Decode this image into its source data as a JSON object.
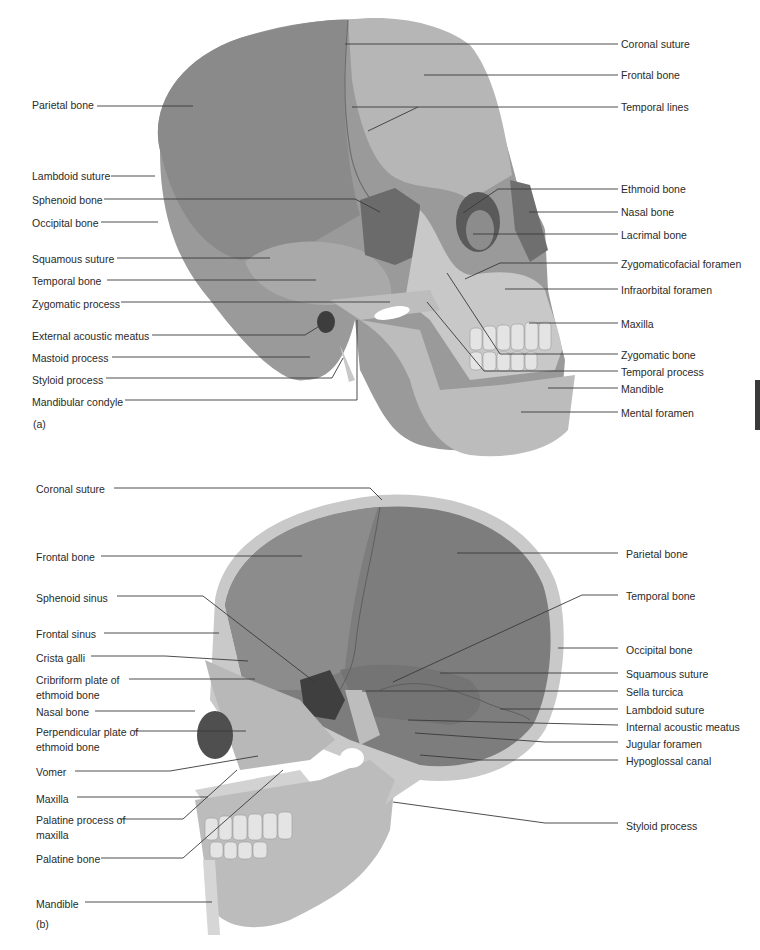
{
  "figure": {
    "colors": {
      "background": "#ffffff",
      "label_text": "#2a2a2a",
      "leader_line": "#3a3a3a",
      "parietal": "#8e8e8e",
      "frontal": "#b4b4b4",
      "sphenoid": "#6e6e6e",
      "face_bone": "#c8c8c8",
      "inner_vault": "#7d7d7d",
      "cut_edge": "#c9c9c9",
      "teeth": "#e4e4e4"
    },
    "panel_a": {
      "tag": "(a)",
      "left_labels": [
        {
          "text": "Parietal bone",
          "x": 32,
          "y": 99,
          "line": [
            [
              97,
              106
            ],
            [
              193,
              106
            ]
          ]
        },
        {
          "text": "Lambdoid suture",
          "x": 32,
          "y": 170,
          "line": [
            [
              111,
              176
            ],
            [
              155,
              176
            ]
          ]
        },
        {
          "text": "Sphenoid bone",
          "x": 32,
          "y": 194,
          "line": [
            [
              104,
              199
            ],
            [
              355,
              199
            ],
            [
              380,
              212
            ]
          ]
        },
        {
          "text": "Occipital bone",
          "x": 32,
          "y": 217,
          "line": [
            [
              101,
              222
            ],
            [
              158,
              222
            ]
          ]
        },
        {
          "text": "Squamous suture",
          "x": 32,
          "y": 253,
          "line": [
            [
              117,
              258
            ],
            [
              270,
              258
            ]
          ]
        },
        {
          "text": "Temporal bone",
          "x": 32,
          "y": 275,
          "line": [
            [
              107,
              280
            ],
            [
              316,
              280
            ]
          ]
        },
        {
          "text": "Zygomatic process",
          "x": 32,
          "y": 298,
          "line": [
            [
              121,
              302
            ],
            [
              390,
              302
            ]
          ]
        },
        {
          "text": "External acoustic meatus",
          "x": 32,
          "y": 330,
          "line": [
            [
              152,
              335
            ],
            [
              305,
              335
            ],
            [
              326,
              322
            ]
          ]
        },
        {
          "text": "Mastoid process",
          "x": 32,
          "y": 352,
          "line": [
            [
              112,
              357
            ],
            [
              310,
              357
            ]
          ]
        },
        {
          "text": "Styloid process",
          "x": 32,
          "y": 374,
          "line": [
            [
              106,
              378
            ],
            [
              332,
              378
            ],
            [
              343,
              358
            ]
          ]
        },
        {
          "text": "Mandibular condyle",
          "x": 32,
          "y": 396,
          "line": [
            [
              125,
              400
            ],
            [
              357,
              400
            ],
            [
              357,
              320
            ]
          ]
        }
      ],
      "right_labels": [
        {
          "text": "Coronal suture",
          "x": 621,
          "y": 38,
          "line": [
            [
              618,
              44
            ],
            [
              345,
              44
            ]
          ]
        },
        {
          "text": "Frontal bone",
          "x": 621,
          "y": 69,
          "line": [
            [
              618,
              75
            ],
            [
              424,
              75
            ]
          ]
        },
        {
          "text": "Temporal lines",
          "x": 621,
          "y": 101,
          "line": [
            [
              618,
              107
            ],
            [
              352,
              107
            ]
          ],
          "extra": [
            [
              418,
              107
            ],
            [
              368,
              131
            ]
          ]
        },
        {
          "text": "Ethmoid bone",
          "x": 621,
          "y": 183,
          "line": [
            [
              618,
              189
            ],
            [
              498,
              189
            ],
            [
              463,
              213
            ]
          ]
        },
        {
          "text": "Nasal bone",
          "x": 621,
          "y": 206,
          "line": [
            [
              618,
              212
            ],
            [
              529,
              212
            ]
          ]
        },
        {
          "text": "Lacrimal bone",
          "x": 621,
          "y": 229,
          "line": [
            [
              618,
              234
            ],
            [
              473,
              234
            ]
          ]
        },
        {
          "text": "Zygomaticofacial foramen",
          "x": 621,
          "y": 258,
          "line": [
            [
              618,
              263
            ],
            [
              500,
              263
            ],
            [
              465,
              279
            ]
          ]
        },
        {
          "text": "Infraorbital foramen",
          "x": 621,
          "y": 284,
          "line": [
            [
              618,
              289
            ],
            [
              505,
              289
            ]
          ]
        },
        {
          "text": "Maxilla",
          "x": 621,
          "y": 318,
          "line": [
            [
              618,
              323
            ],
            [
              529,
              323
            ]
          ]
        },
        {
          "text": "Zygomatic bone",
          "x": 621,
          "y": 349,
          "line": [
            [
              618,
              354
            ],
            [
              500,
              354
            ],
            [
              447,
              273
            ]
          ]
        },
        {
          "text": "Temporal process",
          "x": 621,
          "y": 366,
          "line": [
            [
              618,
              371
            ],
            [
              484,
              371
            ],
            [
              427,
              302
            ]
          ]
        },
        {
          "text": "Mandible",
          "x": 621,
          "y": 383,
          "line": [
            [
              618,
              388
            ],
            [
              548,
              388
            ]
          ]
        },
        {
          "text": "Mental foramen",
          "x": 621,
          "y": 407,
          "line": [
            [
              618,
              412
            ],
            [
              521,
              412
            ]
          ]
        }
      ]
    },
    "panel_b": {
      "tag": "(b)",
      "left_labels": [
        {
          "text": "Coronal suture",
          "x": 36,
          "y": 483,
          "line": [
            [
              114,
              488
            ],
            [
              370,
              488
            ],
            [
              382,
              500
            ]
          ]
        },
        {
          "text": "Frontal bone",
          "x": 36,
          "y": 551,
          "line": [
            [
              101,
              556
            ],
            [
              302,
              556
            ]
          ]
        },
        {
          "text": "Sphenoid sinus",
          "x": 36,
          "y": 592,
          "line": [
            [
              117,
              596
            ],
            [
              203,
              596
            ],
            [
              316,
              683
            ]
          ]
        },
        {
          "text": "Frontal sinus",
          "x": 36,
          "y": 628,
          "line": [
            [
              104,
              633
            ],
            [
              219,
              633
            ]
          ]
        },
        {
          "text": "Crista galli",
          "x": 36,
          "y": 652,
          "line": [
            [
              91,
              656
            ],
            [
              165,
              656
            ],
            [
              248,
              661
            ]
          ]
        },
        {
          "text": "Cribriform plate of ethmoid bone",
          "x": 36,
          "y": 673,
          "multi": true,
          "line": [
            [
              129,
              679
            ],
            [
              255,
              679
            ]
          ]
        },
        {
          "text": "Nasal bone",
          "x": 36,
          "y": 706,
          "line": [
            [
              95,
              711
            ],
            [
              195,
              711
            ]
          ]
        },
        {
          "text": "Perpendicular plate of ethmoid bone",
          "x": 36,
          "y": 725,
          "multi": true,
          "line": [
            [
              134,
              731
            ],
            [
              246,
              731
            ]
          ]
        },
        {
          "text": "Vomer",
          "x": 36,
          "y": 766,
          "line": [
            [
              75,
              771
            ],
            [
              170,
              771
            ],
            [
              258,
              756
            ]
          ]
        },
        {
          "text": "Maxilla",
          "x": 36,
          "y": 793,
          "line": [
            [
              77,
              797
            ],
            [
              208,
              797
            ]
          ]
        },
        {
          "text": "Palatine process of maxilla",
          "x": 36,
          "y": 813,
          "multi": true,
          "line": [
            [
              120,
              819
            ],
            [
              183,
              819
            ],
            [
              237,
              770
            ]
          ]
        },
        {
          "text": "Palatine bone",
          "x": 36,
          "y": 853,
          "line": [
            [
              101,
              858
            ],
            [
              183,
              858
            ],
            [
              283,
              770
            ]
          ]
        },
        {
          "text": "Mandible",
          "x": 36,
          "y": 898,
          "line": [
            [
              85,
              902
            ],
            [
              212,
              902
            ]
          ]
        }
      ],
      "right_labels": [
        {
          "text": "Parietal bone",
          "x": 626,
          "y": 548,
          "line": [
            [
              618,
              553
            ],
            [
              457,
              553
            ]
          ]
        },
        {
          "text": "Temporal bone",
          "x": 626,
          "y": 590,
          "line": [
            [
              618,
              595
            ],
            [
              582,
              595
            ],
            [
              393,
              682
            ]
          ]
        },
        {
          "text": "Occipital bone",
          "x": 626,
          "y": 644,
          "line": [
            [
              618,
              648
            ],
            [
              558,
              648
            ]
          ]
        },
        {
          "text": "Squamous suture",
          "x": 626,
          "y": 668,
          "line": [
            [
              618,
              673
            ],
            [
              440,
              673
            ]
          ]
        },
        {
          "text": "Sella turcica",
          "x": 626,
          "y": 686,
          "line": [
            [
              618,
              691
            ],
            [
              362,
              691
            ]
          ]
        },
        {
          "text": "Lambdoid suture",
          "x": 626,
          "y": 704,
          "line": [
            [
              618,
              709
            ],
            [
              500,
              709
            ]
          ]
        },
        {
          "text": "Internal acoustic meatus",
          "x": 626,
          "y": 721,
          "line": [
            [
              618,
              725
            ],
            [
              408,
              720
            ]
          ]
        },
        {
          "text": "Jugular foramen",
          "x": 626,
          "y": 738,
          "line": [
            [
              618,
              742
            ],
            [
              545,
              742
            ],
            [
              415,
              733
            ]
          ]
        },
        {
          "text": "Hypoglossal canal",
          "x": 626,
          "y": 755,
          "line": [
            [
              618,
              760
            ],
            [
              480,
              760
            ],
            [
              420,
              755
            ]
          ]
        },
        {
          "text": "Styloid process",
          "x": 626,
          "y": 820,
          "line": [
            [
              618,
              823
            ],
            [
              545,
              823
            ],
            [
              393,
              802
            ]
          ]
        }
      ]
    }
  }
}
